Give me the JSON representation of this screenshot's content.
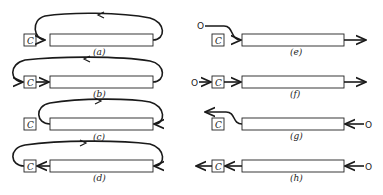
{
  "diagram": {
    "component_label": "C",
    "source_label": "O",
    "panels": [
      {
        "id": "a",
        "label": "(a)",
        "column": "left",
        "flow": "loop from bar right end over top back into bar left end, bypassing C"
      },
      {
        "id": "b",
        "label": "(b)",
        "column": "left",
        "flow": "loop from bar right end over top into C, C feeds bar"
      },
      {
        "id": "c",
        "label": "(c)",
        "column": "left",
        "flow": "loop from bar left end over top into bar right end, bypassing C"
      },
      {
        "id": "d",
        "label": "(d)",
        "column": "left",
        "flow": "bar feeds C, loop from C over top into bar right end"
      },
      {
        "id": "e",
        "label": "(e)",
        "column": "right",
        "flow": "O bypasses C into bar left end, bar outputs right"
      },
      {
        "id": "f",
        "label": "(f)",
        "column": "right",
        "flow": "O feeds C, C feeds bar, bar outputs right"
      },
      {
        "id": "g",
        "label": "(g)",
        "column": "right",
        "flow": "O enters bar right end, bar left end outputs bypassing C"
      },
      {
        "id": "h",
        "label": "(h)",
        "column": "right",
        "flow": "O enters bar right end, bar feeds C, C outputs left"
      }
    ]
  }
}
